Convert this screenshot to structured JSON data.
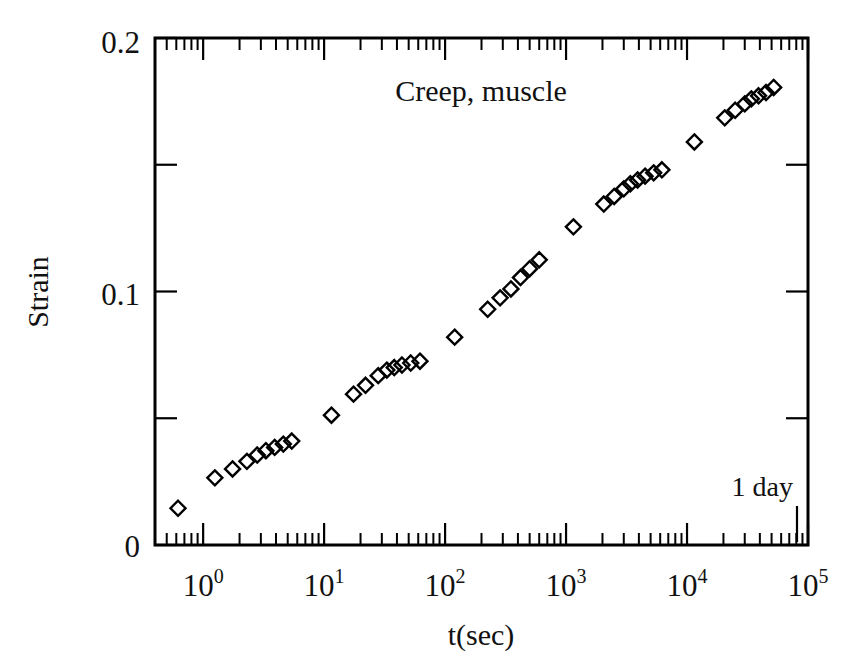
{
  "figure": {
    "background_color": "#ffffff",
    "ink_color": "#000000"
  },
  "chart_data": {
    "type": "scatter",
    "title": "Creep, muscle",
    "xlabel": "t(sec)",
    "ylabel": "Strain",
    "xscale": "log",
    "yscale": "linear",
    "xlim": [
      0.4,
      100000
    ],
    "ylim": [
      0,
      0.2
    ],
    "grid": false,
    "legend": null,
    "marker": "open-diamond",
    "x_tick_labels": [
      "10^0",
      "10^1",
      "10^2",
      "10^3",
      "10^4",
      "10^5"
    ],
    "x_tick_mantissa": [
      "10",
      "10",
      "10",
      "10",
      "10",
      "10"
    ],
    "x_tick_exponent": [
      "0",
      "1",
      "2",
      "3",
      "4",
      "5"
    ],
    "x_tick_values": [
      1,
      10,
      100,
      1000,
      10000,
      100000
    ],
    "y_tick_labels": [
      "0",
      "0.1",
      "0.2"
    ],
    "y_tick_values": [
      0,
      0.1,
      0.2
    ],
    "y_minor_tick_values": [
      0.05,
      0.15
    ],
    "annotations": [
      {
        "text": "1 day",
        "x": 86400,
        "y": 0.035,
        "marker": "vertical-tick"
      }
    ],
    "series": [
      {
        "name": "Creep strain, muscle",
        "x": [
          0.62,
          1.25,
          1.75,
          2.3,
          2.8,
          3.3,
          3.9,
          4.6,
          5.4,
          11.5,
          17.5,
          22.0,
          28.0,
          33.0,
          38.0,
          44.0,
          52.0,
          62.0,
          120.0,
          225.0,
          285.0,
          350.0,
          420.0,
          500.0,
          600.0,
          1150.0,
          2050.0,
          2500.0,
          3000.0,
          3400.0,
          3900.0,
          4500.0,
          5300.0,
          6200.0,
          11500.0,
          20500.0,
          25000.0,
          30000.0,
          34000.0,
          39000.0,
          45000.0,
          52000.0
        ],
        "y": [
          0.0145,
          0.0265,
          0.03,
          0.033,
          0.0355,
          0.0372,
          0.0385,
          0.0398,
          0.041,
          0.0512,
          0.0595,
          0.063,
          0.0668,
          0.069,
          0.07,
          0.071,
          0.0718,
          0.0725,
          0.082,
          0.093,
          0.0975,
          0.101,
          0.1055,
          0.109,
          0.1125,
          0.1255,
          0.1345,
          0.1375,
          0.1405,
          0.1425,
          0.144,
          0.1455,
          0.1468,
          0.148,
          0.159,
          0.1685,
          0.1715,
          0.174,
          0.176,
          0.1772,
          0.1785,
          0.1805
        ]
      }
    ]
  }
}
